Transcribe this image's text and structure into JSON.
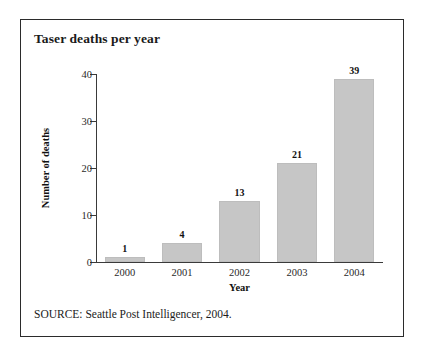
{
  "figure": {
    "title": "Taser deaths per year",
    "source_note": "SOURCE: Seattle Post Intelligencer, 2004.",
    "border_color": "#2b2b2b",
    "background": "#ffffff"
  },
  "chart_data": {
    "type": "bar",
    "title": "Taser deaths per year",
    "categories": [
      "2000",
      "2001",
      "2002",
      "2003",
      "2004"
    ],
    "values": [
      1,
      4,
      13,
      21,
      39
    ],
    "xlabel": "Year",
    "ylabel": "Number of deaths",
    "ylim": [
      0,
      40
    ],
    "yticks": [
      0,
      10,
      20,
      30,
      40
    ],
    "ytick_labels": [
      "0",
      "10",
      "20",
      "30",
      "40"
    ],
    "grid": false,
    "legend": false,
    "bar_color": "#c6c6c6",
    "data_labels": [
      "1",
      "4",
      "13",
      "21",
      "39"
    ]
  }
}
